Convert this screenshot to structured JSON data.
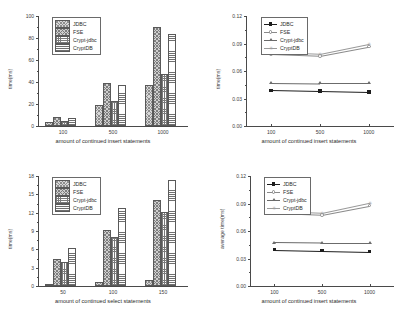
{
  "series_names": [
    "JDBC",
    "FSE",
    "Crypt-jdbc",
    "CryptDB"
  ],
  "chart_data": [
    {
      "id": "top-left",
      "type": "bar",
      "title": "",
      "xlabel": "amount of continued insert statements",
      "ylabel": "time(ms)",
      "categories": [
        "100",
        "500",
        "1000"
      ],
      "ylim": [
        0,
        100
      ],
      "yticks": [
        "0",
        "20",
        "40",
        "60",
        "80",
        "100"
      ],
      "grid": false,
      "legend_position": "top-left",
      "series": [
        {
          "name": "JDBC",
          "values": [
            4,
            19,
            37
          ]
        },
        {
          "name": "FSE",
          "values": [
            8.5,
            39,
            90
          ]
        },
        {
          "name": "Crypt-jdbc",
          "values": [
            4.5,
            23,
            47
          ]
        },
        {
          "name": "CryptDB",
          "values": [
            7.5,
            37,
            84
          ]
        }
      ]
    },
    {
      "id": "top-right",
      "type": "line",
      "title": "",
      "xlabel": "amount of continued insert statements",
      "ylabel": "time(ms)",
      "x": [
        "100",
        "500",
        "1000"
      ],
      "ylim": [
        0.0,
        0.12
      ],
      "yticks": [
        "0.00",
        "0.03",
        "0.06",
        "0.09",
        "0.12"
      ],
      "grid": false,
      "legend_position": "top-left",
      "series": [
        {
          "name": "JDBC",
          "marker": "square",
          "values": [
            0.039,
            0.038,
            0.037
          ]
        },
        {
          "name": "FSE",
          "marker": "circle",
          "values": [
            0.0785,
            0.0765,
            0.0865
          ]
        },
        {
          "name": "Crypt-jdbc",
          "marker": "triangle",
          "values": [
            0.047,
            0.0465,
            0.0465
          ]
        },
        {
          "name": "CryptDB",
          "marker": "plus",
          "values": [
            0.0805,
            0.0785,
            0.0895
          ]
        }
      ]
    },
    {
      "id": "bottom-left",
      "type": "bar",
      "title": "",
      "xlabel": "amount of continued select statements",
      "ylabel": "time(ms)",
      "categories": [
        "50",
        "100",
        "150"
      ],
      "ylim": [
        0,
        18
      ],
      "yticks": [
        "0",
        "3",
        "6",
        "9",
        "12",
        "15",
        "18"
      ],
      "grid": false,
      "legend_position": "top-left",
      "series": [
        {
          "name": "JDBC",
          "values": [
            0.3,
            0.7,
            1.0
          ]
        },
        {
          "name": "FSE",
          "values": [
            4.5,
            9.2,
            14.0
          ]
        },
        {
          "name": "Crypt-jdbc",
          "values": [
            4.0,
            8.1,
            12.1
          ]
        },
        {
          "name": "CryptDB",
          "values": [
            6.2,
            12.7,
            17.4
          ]
        }
      ]
    },
    {
      "id": "bottom-right",
      "type": "line",
      "title": "",
      "xlabel": "amount of continued insert statements",
      "ylabel": "average time(ms)",
      "x": [
        "100",
        "500",
        "1000"
      ],
      "ylim": [
        0.0,
        0.12
      ],
      "yticks": [
        "0.00",
        "0.03",
        "0.06",
        "0.09",
        "0.12"
      ],
      "grid": false,
      "legend_position": "top-left",
      "series": [
        {
          "name": "JDBC",
          "marker": "square",
          "values": [
            0.0395,
            0.0385,
            0.0375
          ]
        },
        {
          "name": "FSE",
          "marker": "circle",
          "values": [
            0.0795,
            0.0775,
            0.0875
          ]
        },
        {
          "name": "Crypt-jdbc",
          "marker": "triangle",
          "values": [
            0.0475,
            0.047,
            0.047
          ]
        },
        {
          "name": "CryptDB",
          "marker": "plus",
          "values": [
            0.0815,
            0.0795,
            0.0905
          ]
        }
      ]
    }
  ],
  "colors": {
    "axis": "#4a4a4a",
    "text": "#2b2b2b",
    "jdbc": "#1d1d1d",
    "fse": "#8a8a8a",
    "crypt_jdbc": "#6b6b6b",
    "cryptdb": "#9a9a9a"
  }
}
